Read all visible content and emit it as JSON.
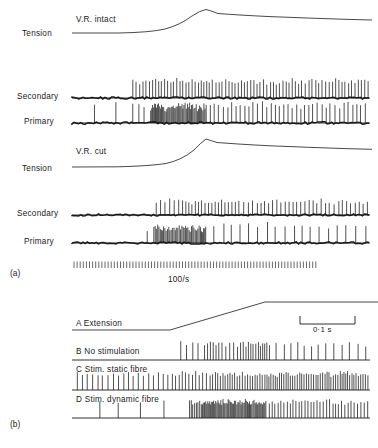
{
  "figure": {
    "type": "scientific-recording-figure",
    "background": "#ffffff",
    "ink": "#1a1a1a",
    "width": 378,
    "height": 448
  },
  "panel_a": {
    "tag": "(a)",
    "time_marker_label": "100/s",
    "blocks": [
      {
        "condition_label": "V.R. intact",
        "trace_label": "Tension",
        "channels": [
          {
            "label": "Secondary"
          },
          {
            "label": "Primary"
          }
        ]
      },
      {
        "condition_label": "V.R. cut",
        "trace_label": "Tension",
        "channels": [
          {
            "label": "Secondary"
          },
          {
            "label": "Primary"
          }
        ]
      }
    ]
  },
  "panel_b": {
    "tag": "(b)",
    "scale_label": "0·1 s",
    "rows": [
      {
        "key": "A",
        "label": "A  Extension"
      },
      {
        "key": "B",
        "label": "B  No stimulation"
      },
      {
        "key": "C",
        "label": "C  Stim. static fibre"
      },
      {
        "key": "D",
        "label": "D  Stim. dynamic fibre"
      }
    ]
  },
  "chart_data": {
    "type": "line",
    "title": "",
    "xlabel": "",
    "ylabel": "",
    "grid": false,
    "legend_position": "none",
    "traces": [
      {
        "name": "tension-vr-intact",
        "panel": "a",
        "kind": "tension",
        "x": [
          72,
          110,
          140,
          160,
          175,
          185,
          195,
          202,
          208,
          215,
          230,
          250,
          275,
          300,
          330,
          360,
          372
        ],
        "y": [
          33,
          33,
          32.5,
          31,
          28,
          24,
          18,
          13,
          10.5,
          12,
          14,
          15.5,
          16.5,
          17.5,
          18.5,
          19.5,
          20
        ]
      },
      {
        "name": "tension-vr-cut",
        "panel": "a",
        "kind": "tension",
        "x": [
          72,
          110,
          140,
          160,
          175,
          185,
          195,
          202,
          208,
          215,
          230,
          250,
          275,
          300,
          330,
          360,
          372
        ],
        "y": [
          167,
          167,
          166.5,
          165,
          161,
          156,
          149,
          143,
          139.5,
          141.5,
          143.5,
          145,
          146,
          147,
          148,
          149,
          149.5
        ]
      },
      {
        "name": "extension-ramp",
        "panel": "b",
        "kind": "ramp",
        "x": [
          72,
          170,
          265,
          378
        ],
        "y": [
          330,
          330,
          302,
          302
        ]
      }
    ],
    "spike_trains": [
      {
        "name": "secondary-vr-intact",
        "panel": "a",
        "baseline_y": 98,
        "x_start": 72,
        "x_end": 370,
        "onset_x": 130,
        "description": "silent then regular high-rate discharge from onset, sustained to end",
        "spike_height": 16
      },
      {
        "name": "primary-vr-intact",
        "panel": "a",
        "baseline_y": 123,
        "x_start": 72,
        "x_end": 370,
        "onset_x": 78,
        "description": "sparse resting discharge, dense burst during dynamic phase, then regular firing",
        "spike_height": 18
      },
      {
        "name": "secondary-vr-cut",
        "panel": "a",
        "baseline_y": 215,
        "x_start": 72,
        "x_end": 370,
        "onset_x": 152,
        "description": "silent then regular discharge from onset to end",
        "spike_height": 14
      },
      {
        "name": "primary-vr-cut",
        "panel": "a",
        "baseline_y": 243,
        "x_start": 72,
        "x_end": 370,
        "onset_x": 140,
        "description": "dense burst during ramp then sparse irregular firing",
        "spike_height": 17
      },
      {
        "name": "time-marker-100-per-s",
        "panel": "a",
        "baseline_y": 268,
        "x_start": 72,
        "x_end": 318,
        "description": "uniform timing ticks at 100 per second",
        "spike_height": 6
      },
      {
        "name": "no-stimulation",
        "panel": "b",
        "baseline_y": 360,
        "x_start": 72,
        "x_end": 370,
        "onset_x": 175,
        "description": "discharge begins at ramp onset, peaks mid-ramp, slows during plateau",
        "spike_height": 16
      },
      {
        "name": "stim-static-fibre",
        "panel": "b",
        "baseline_y": 390,
        "x_start": 72,
        "x_end": 370,
        "onset_x": 72,
        "description": "maintained resting discharge throughout, rate increases with extension",
        "spike_height": 16
      },
      {
        "name": "stim-dynamic-fibre",
        "panel": "b",
        "baseline_y": 418,
        "x_start": 72,
        "x_end": 370,
        "onset_x": 80,
        "description": "sparse resting discharge, intense burst during ramp, regular firing on plateau",
        "spike_height": 16
      }
    ],
    "scale_bar": {
      "label": "0·1 s",
      "x_left": 300,
      "x_right": 355,
      "y": 322
    }
  }
}
